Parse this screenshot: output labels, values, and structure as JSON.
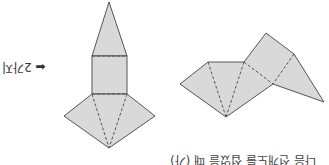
{
  "orientation": "rotated-180",
  "figure": {
    "fill_color": "#d9d9d9",
    "stroke_color": "#555555",
    "fold_line_style": "dashed",
    "nets": [
      {
        "name": "left-net",
        "description": "pyramid-like net: triangle, square, triangular sides"
      },
      {
        "name": "right-net",
        "description": "net of triangular faces"
      }
    ]
  },
  "labels": {
    "count_arrow_text": "⬅ 2가지",
    "caption": "다음 전개도를 접었을 때 (가)"
  }
}
